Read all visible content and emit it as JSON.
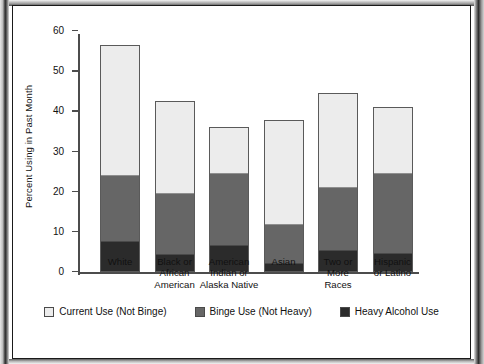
{
  "figure": {
    "ylabel": "Percent Using in Past Month"
  },
  "chart_data": {
    "type": "bar",
    "subtype": "stacked-bar",
    "title": "",
    "subtitle": "",
    "xlabel": "",
    "ylabel": "Percent Using in Past Month",
    "ylim": [
      0,
      60
    ],
    "ytick_labels": [
      "0",
      "10",
      "20",
      "30",
      "40",
      "50",
      "60"
    ],
    "ytick_values": [
      0,
      10,
      20,
      30,
      40,
      50,
      60
    ],
    "grid": false,
    "legend_position": "bottom",
    "categories": [
      "White",
      "Black or African American",
      "American Indian or Alaska Native",
      "Asian",
      "Two or More Races",
      "Hispanic or Latino"
    ],
    "category_label_lines": [
      [
        "White"
      ],
      [
        "Black or",
        "African",
        "American"
      ],
      [
        "American",
        "Indian or",
        "Alaska Native"
      ],
      [
        "Asian"
      ],
      [
        "Two or",
        "More",
        "Races"
      ],
      [
        "Hispanic",
        "or Latino"
      ]
    ],
    "series": [
      {
        "name": "Heavy Alcohol Use",
        "color": "#2b2b2b",
        "values": [
          7.7,
          4.4,
          6.6,
          2.0,
          5.4,
          4.6
        ]
      },
      {
        "name": "Binge Use (Not Heavy)",
        "color": "#666666",
        "values": [
          16.5,
          15.3,
          18.2,
          10.0,
          15.8,
          20.2
        ]
      },
      {
        "name": "Current Use (Not Binge)",
        "color": "#ececec",
        "values": [
          32.4,
          22.9,
          11.5,
          25.9,
          23.5,
          16.4
        ]
      }
    ],
    "cumulative_tops": {
      "heavy": [
        7.7,
        4.4,
        6.6,
        2.0,
        5.4,
        4.6
      ],
      "binge": [
        24.2,
        19.7,
        24.8,
        12.0,
        21.2,
        24.8
      ],
      "total": [
        56.6,
        42.6,
        36.3,
        37.9,
        44.7,
        41.2
      ]
    },
    "legend": [
      {
        "label": "Current Use (Not Binge)",
        "color": "#ececec",
        "swatch": "light"
      },
      {
        "label": "Binge Use (Not Heavy)",
        "color": "#666666",
        "swatch": "mid"
      },
      {
        "label": "Heavy Alcohol Use",
        "color": "#2b2b2b",
        "swatch": "dark"
      }
    ]
  }
}
